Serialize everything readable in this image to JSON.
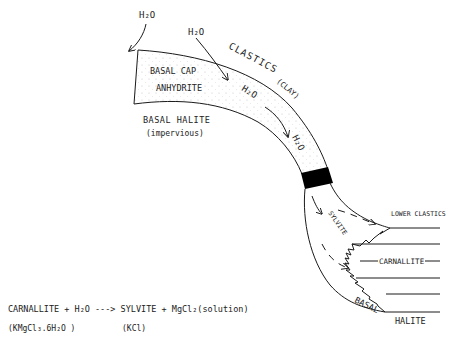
{
  "diagram": {
    "labels": {
      "water_top_left": "H₂O",
      "water_top_mid": "H₂O",
      "clastics": "CLASTICS",
      "clay": "(CLAY)",
      "basal_cap": "BASAL CAP",
      "anhydrite": "ANHYDRITE",
      "basal_halite": "BASAL HALITE",
      "impervious": "(impervious)",
      "water_mid": "H₂O",
      "water_lower": "H₂O",
      "sylvite": "SYLVITE",
      "lower_clastics": "LOWER CLASTICS",
      "carnallite": "CARNALLITE",
      "basal": "BASAL",
      "halite": "HALITE"
    },
    "equation": {
      "line1": "CARNALLITE + H₂O ---> SYLVITE + MgCl₂(solution)",
      "carnallite_formula": "(KMgCl₃.6H₂O )",
      "sylvite_formula": "(KCl)"
    },
    "colors": {
      "ink": "#1a1a1a",
      "stipple": "#c8c8c8",
      "block": "#000000",
      "background": "#ffffff"
    }
  }
}
